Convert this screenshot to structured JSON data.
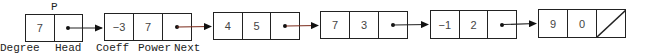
{
  "head": {
    "pointer_label": "P",
    "degree": "7"
  },
  "nodes": [
    {
      "coeff": "−3",
      "power": "7",
      "next": "pointer"
    },
    {
      "coeff": "4",
      "power": "5",
      "next": "pointer"
    },
    {
      "coeff": "7",
      "power": "3",
      "next": "pointer"
    },
    {
      "coeff": "−1",
      "power": "2",
      "next": "pointer"
    },
    {
      "coeff": "9",
      "power": "0",
      "next": "null"
    }
  ],
  "labels": {
    "degree": "Degree",
    "head": "Head",
    "coeff": "Coeff",
    "power": "Power",
    "next": "Next"
  },
  "colors": {
    "line": "#222222",
    "arrow_accent": "#7a2a1a"
  }
}
